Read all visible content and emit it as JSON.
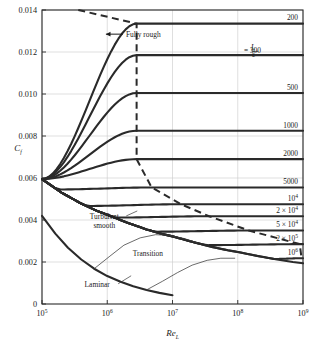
{
  "chart_data": {
    "type": "line",
    "title": "",
    "xlabel": "Re_L",
    "ylabel": "C_f",
    "xlabel_base": "Re",
    "xlabel_sub": "L",
    "ylabel_base": "C",
    "ylabel_sub": "f",
    "xscale": "log",
    "xlim": [
      100000,
      1000000000
    ],
    "ylim": [
      0,
      0.014
    ],
    "grid": true,
    "xticks": [
      {
        "value": 100000,
        "base": "10",
        "exp": "5"
      },
      {
        "value": 1000000,
        "base": "10",
        "exp": "6"
      },
      {
        "value": 10000000,
        "base": "10",
        "exp": "7"
      },
      {
        "value": 100000000,
        "base": "10",
        "exp": "8"
      },
      {
        "value": 1000000000,
        "base": "10",
        "exp": "9"
      }
    ],
    "yticks": [
      {
        "value": 0,
        "label": "0"
      },
      {
        "value": 0.002,
        "label": "0.002"
      },
      {
        "value": 0.004,
        "label": "0.004"
      },
      {
        "value": 0.006,
        "label": "0.006"
      },
      {
        "value": 0.008,
        "label": "0.008"
      },
      {
        "value": 0.01,
        "label": "0.010"
      },
      {
        "value": 0.012,
        "label": "0.012"
      },
      {
        "value": 0.014,
        "label": "0.014"
      }
    ],
    "annotations": [
      {
        "name": "fully-rough",
        "text": "Fully rough",
        "x": 1800000,
        "y": 0.01285,
        "arrow": true
      },
      {
        "name": "turbulent-smooth",
        "line1": "Turbulent",
        "line2": "smooth",
        "x": 900000,
        "y": 0.00405
      },
      {
        "name": "transition",
        "text": "Transition",
        "x": 4200000,
        "y": 0.00228
      },
      {
        "name": "laminar",
        "text": "Laminar",
        "x": 700000,
        "y": 0.00082
      }
    ],
    "roughness_label_prefix": "L",
    "roughness_label_denom": "ε",
    "roughness_label_eq": "= 300",
    "series": [
      {
        "name": "L/eps = 200",
        "label": "200",
        "plateau": 0.01335,
        "label_has_fraction": false
      },
      {
        "name": "L/eps = 300",
        "label": "300",
        "plateau": 0.01185,
        "label_has_fraction": true
      },
      {
        "name": "L/eps = 500",
        "label": "500",
        "plateau": 0.01005,
        "label_has_fraction": false
      },
      {
        "name": "L/eps = 1000",
        "label": "1000",
        "plateau": 0.00825,
        "label_has_fraction": false
      },
      {
        "name": "L/eps = 2000",
        "label": "2000",
        "plateau": 0.0069,
        "label_has_fraction": false
      },
      {
        "name": "L/eps = 5000",
        "label": "5000",
        "plateau": 0.00555,
        "label_has_fraction": false
      },
      {
        "name": "L/eps = 10^4",
        "label": "10",
        "exp": "4",
        "plateau": 0.00475,
        "label_has_fraction": false
      },
      {
        "name": "L/eps = 2x10^4",
        "label": "2 × 10",
        "exp": "4",
        "plateau": 0.00418,
        "label_has_fraction": false
      },
      {
        "name": "L/eps = 5x10^4",
        "label": "5 × 10",
        "exp": "4",
        "plateau": 0.0035,
        "label_has_fraction": false
      },
      {
        "name": "L/eps = 2x10^5",
        "label": "2 × 10",
        "exp": "5",
        "plateau": 0.00285,
        "label_has_fraction": false
      },
      {
        "name": "L/eps = 10^6",
        "label": "10",
        "exp": "6",
        "plateau": 0.00218,
        "label_has_fraction": false
      }
    ],
    "curves_note": "Turbulent smooth baseline, laminar branch, transition arcs and dashed fully-rough locus"
  }
}
